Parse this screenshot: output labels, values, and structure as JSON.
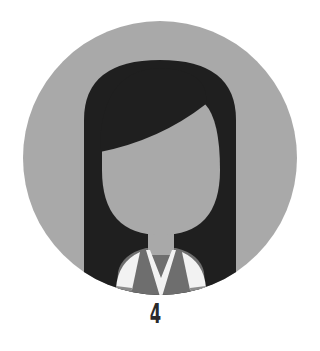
{
  "avatar": {
    "icon": "female-user-avatar-icon",
    "colors": {
      "background": "#a9a9a9",
      "hair": "#1f1f1f",
      "face": "#a9a9a9",
      "vest": "#6e6e6e",
      "shirt": "#f2f2f2",
      "sleeve_band": "#8c8c8c"
    }
  },
  "label": "4"
}
